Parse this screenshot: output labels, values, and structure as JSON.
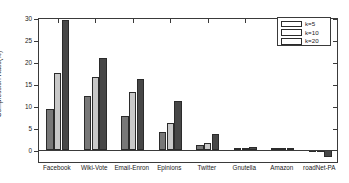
{
  "chart_data": {
    "type": "bar",
    "title": "",
    "xlabel": "",
    "ylabel": "Compression Ratio(%)",
    "ylim": [
      -3,
      30
    ],
    "yticks": [
      0,
      5,
      10,
      15,
      20,
      25,
      30
    ],
    "ytick_labels": [
      "0",
      "5",
      "10",
      "15",
      "20",
      "25",
      "30"
    ],
    "grid": false,
    "legend_position": "top-right",
    "categories": [
      "Facebook",
      "Wiki-Vote",
      "Email-Enron",
      "Epinions",
      "Twitter",
      "Gnutella",
      "Amazon",
      "roadNet-PA"
    ],
    "series": [
      {
        "name": "k=5",
        "color": "#787878",
        "values": [
          9.4,
          12.3,
          7.8,
          4.2,
          1.1,
          0.45,
          0.3,
          -0.15
        ]
      },
      {
        "name": "k=10",
        "color": "#c8c8c8",
        "values": [
          17.6,
          16.6,
          13.1,
          6.1,
          1.6,
          0.55,
          0.35,
          -0.3
        ]
      },
      {
        "name": "k=20",
        "color": "#474747",
        "values": [
          29.5,
          20.9,
          16.1,
          11.2,
          3.6,
          0.7,
          0.4,
          -1.7
        ]
      }
    ]
  },
  "axis": {
    "line_color": "#3a3a3a",
    "background": "#ffffff"
  }
}
